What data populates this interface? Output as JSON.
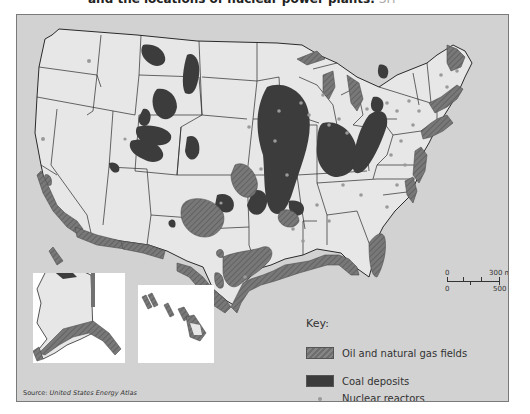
{
  "caption": {
    "text": "and the locations of nuclear power plants.",
    "ref": "SH"
  },
  "map": {
    "title": "United States energy resources",
    "colors": {
      "ocean": "#d2d2d2",
      "land": "#e7e7e7",
      "borders": "#2a2a2a",
      "coal": "#3c3c3c",
      "oil_gas": "#717171",
      "nuclear": "#9a9a9a",
      "inset_background": "#ffffff"
    },
    "insets": [
      {
        "name": "Alaska"
      },
      {
        "name": "Hawaii"
      }
    ]
  },
  "key": {
    "title": "Key:",
    "items": [
      {
        "label": "Oil and natural gas fields",
        "symbol": "hatched-swatch"
      },
      {
        "label": "Coal deposits",
        "symbol": "dark-swatch"
      },
      {
        "label": "Nuclear reactors",
        "symbol": "dot"
      }
    ]
  },
  "scale": {
    "miles_zero": "0",
    "miles_label": "300 mi",
    "km_zero": "0",
    "km_label": "500 km"
  },
  "source": {
    "prefix": "Source:",
    "name": "United States Energy Atlas"
  }
}
